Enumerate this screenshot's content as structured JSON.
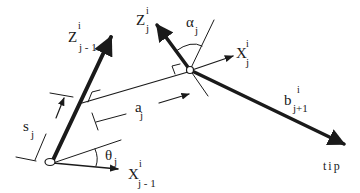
{
  "diagram": {
    "type": "kinematic-joint-frame",
    "labels": {
      "z_prev": {
        "base": "Z",
        "sup": "i",
        "sub": "j - 1"
      },
      "z_j": {
        "base": "Z",
        "sup": "i",
        "sub": "j"
      },
      "x_j": {
        "base": "X",
        "sup": "i",
        "sub": "j"
      },
      "x_prev": {
        "base": "X",
        "sup": "i",
        "sub": "j - 1"
      },
      "alpha": {
        "base": "α",
        "sub": "j"
      },
      "theta": {
        "base": "θ",
        "sub": "j"
      },
      "a": {
        "base": "a",
        "sub": "j"
      },
      "s": {
        "base": "s",
        "sub": "j"
      },
      "b": {
        "base": "b",
        "sup": "i",
        "sub": "j+1"
      },
      "tip": "tip"
    },
    "colors": {
      "stroke": "#1a1a1a",
      "background": "#ffffff"
    }
  }
}
